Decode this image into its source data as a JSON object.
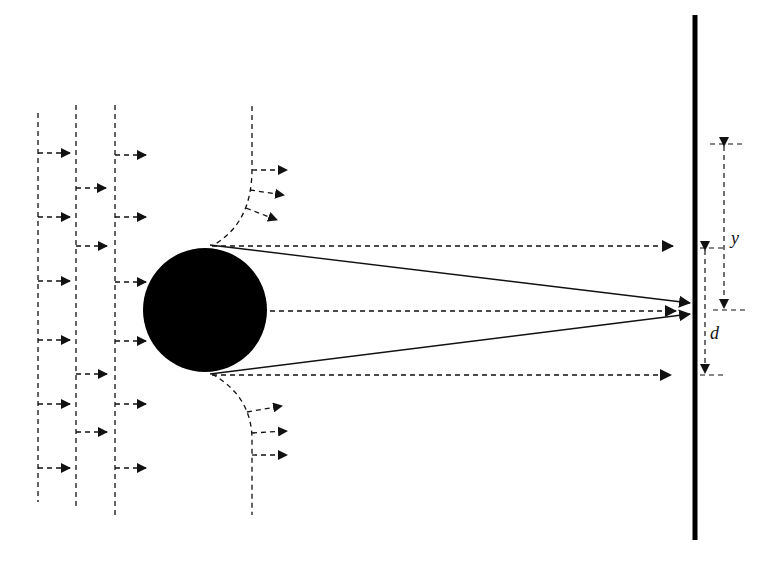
{
  "diagram": {
    "labels": {
      "y": "y",
      "d": "d"
    },
    "colors": {
      "ink": "#111111",
      "particle": "#000000",
      "background": "#ffffff"
    },
    "streamlines": {
      "straight_x": [
        38,
        76,
        115
      ],
      "straight_top": [
        113,
        105,
        105
      ],
      "straight_bottom": [
        502,
        507,
        515
      ],
      "arrows": [
        {
          "line": 0,
          "ys": [
            153,
            217,
            281,
            340,
            404,
            468
          ]
        },
        {
          "line": 1,
          "ys": [
            188,
            246,
            374,
            432
          ]
        },
        {
          "line": 2,
          "ys": [
            155,
            217,
            282,
            341,
            404,
            468
          ]
        }
      ]
    },
    "particle": {
      "cx": 205,
      "cy": 310,
      "r": 62
    },
    "wall": {
      "x": 695,
      "y_top": 15,
      "y_bottom": 540
    },
    "dimensions": {
      "y": {
        "x": 724,
        "y_from": 144,
        "y_to": 310
      },
      "d": {
        "x": 705,
        "y_from": 248,
        "y_to": 375
      }
    }
  }
}
